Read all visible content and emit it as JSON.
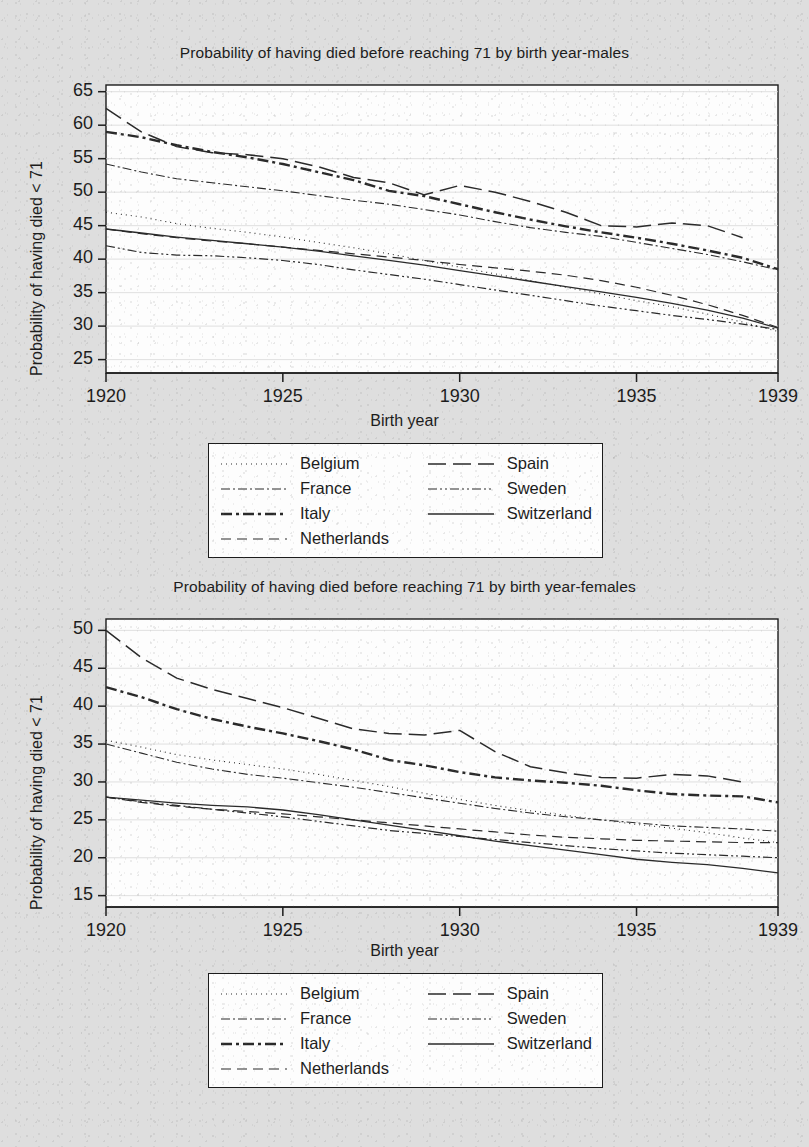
{
  "figure": {
    "background_color": "#dedede",
    "panel_background": "#fdfdfd",
    "line_color": "#2a2a2a",
    "axis_color": "#1c1c1c",
    "grid_color": "#d8d8d8"
  },
  "panels": [
    {
      "id": "males",
      "title": "Probability of having died before reaching 71 by birth year-males",
      "xlabel": "Birth year",
      "ylabel": "Probability of having died < 71",
      "yticks": [
        25,
        30,
        35,
        40,
        45,
        50,
        55,
        60,
        65
      ],
      "xticks": [
        1920,
        1925,
        1930,
        1935,
        1939
      ]
    },
    {
      "id": "females",
      "title": "Probability of having died before reaching 71 by birth year-females",
      "xlabel": "Birth year",
      "ylabel": "Probability of having died < 71",
      "yticks": [
        15,
        20,
        25,
        30,
        35,
        40,
        45,
        50
      ],
      "xticks": [
        1920,
        1925,
        1930,
        1935,
        1939
      ]
    }
  ],
  "legend": {
    "columns": [
      [
        {
          "label": "Belgium",
          "dash": "1,4",
          "width": 1.1
        },
        {
          "label": "France",
          "dash": "9,3,2,3",
          "width": 1.1
        },
        {
          "label": "Italy",
          "dash": "11,4,3,4",
          "width": 2.4
        },
        {
          "label": "Netherlands",
          "dash": "10,6",
          "width": 1.2
        }
      ],
      [
        {
          "label": "Spain",
          "dash": "18,7",
          "width": 1.5
        },
        {
          "label": "Sweden",
          "dash": "9,3,2,3,2,3",
          "width": 1.2
        },
        {
          "label": "Switzerland",
          "dash": "none",
          "width": 1.3
        }
      ]
    ]
  },
  "chart_data": [
    {
      "type": "line",
      "id": "males",
      "title": "Probability of having died before reaching 71 by birth year-males",
      "xlabel": "Birth year",
      "ylabel": "Probability of having died < 71",
      "xlim": [
        1920,
        1939
      ],
      "ylim": [
        23,
        66
      ],
      "ytick_values": [
        25,
        30,
        35,
        40,
        45,
        50,
        55,
        60,
        65
      ],
      "xtick_values": [
        1920,
        1925,
        1930,
        1935,
        1939
      ],
      "grid": "horizontal",
      "legend_position": "below-plot",
      "x": [
        1920,
        1921,
        1922,
        1923,
        1924,
        1925,
        1926,
        1927,
        1928,
        1929,
        1930,
        1931,
        1932,
        1933,
        1934,
        1935,
        1936,
        1937,
        1938,
        1939
      ],
      "series": [
        {
          "name": "Belgium",
          "dash": "1,4",
          "width": 1.1,
          "values": [
            47.0,
            46.3,
            45.3,
            44.6,
            44.0,
            43.3,
            42.5,
            41.7,
            40.8,
            39.8,
            38.8,
            37.8,
            36.8,
            35.8,
            34.8,
            33.8,
            32.9,
            31.8,
            30.6,
            29.2
          ]
        },
        {
          "name": "France",
          "dash": "9,3,2,3",
          "width": 1.1,
          "values": [
            54.2,
            53.0,
            52.0,
            51.4,
            50.8,
            50.2,
            49.5,
            48.8,
            48.2,
            47.4,
            46.6,
            45.6,
            44.7,
            44.0,
            43.4,
            42.5,
            41.6,
            40.7,
            39.6,
            38.4
          ]
        },
        {
          "name": "Italy",
          "dash": "11,4,3,4",
          "width": 2.4,
          "values": [
            59.0,
            58.2,
            57.0,
            56.0,
            55.2,
            54.2,
            53.0,
            51.8,
            50.2,
            49.4,
            48.2,
            47.0,
            45.9,
            44.9,
            44.0,
            43.2,
            42.3,
            41.3,
            40.2,
            38.5
          ]
        },
        {
          "name": "Netherlands",
          "dash": "10,6",
          "width": 1.2,
          "values": [
            44.5,
            43.8,
            43.2,
            42.7,
            42.3,
            41.8,
            41.3,
            40.8,
            40.3,
            39.8,
            39.2,
            38.7,
            38.2,
            37.6,
            36.8,
            35.8,
            34.6,
            33.2,
            31.6,
            29.8
          ]
        },
        {
          "name": "Spain",
          "dash": "18,7",
          "width": 1.5,
          "values": [
            62.5,
            59.0,
            56.8,
            55.9,
            55.6,
            55.0,
            53.8,
            52.2,
            51.4,
            49.6,
            51.0,
            50.0,
            48.6,
            47.0,
            45.0,
            44.8,
            45.4,
            45.0,
            43.2,
            null
          ]
        },
        {
          "name": "Sweden",
          "dash": "9,3,2,3,2,3",
          "width": 1.2,
          "values": [
            42.0,
            41.0,
            40.6,
            40.5,
            40.2,
            39.8,
            39.2,
            38.4,
            37.7,
            37.0,
            36.2,
            35.4,
            34.6,
            33.8,
            33.0,
            32.3,
            31.6,
            31.0,
            30.3,
            29.5
          ]
        },
        {
          "name": "Switzerland",
          "dash": "none",
          "width": 1.3,
          "values": [
            44.5,
            43.9,
            43.3,
            42.8,
            42.3,
            41.8,
            41.2,
            40.5,
            39.8,
            39.1,
            38.3,
            37.5,
            36.7,
            35.9,
            35.1,
            34.3,
            33.4,
            32.4,
            31.2,
            29.7
          ]
        }
      ]
    },
    {
      "type": "line",
      "id": "females",
      "title": "Probability of having died before reaching 71 by birth year-females",
      "xlabel": "Birth year",
      "ylabel": "Probability of having died < 71",
      "xlim": [
        1920,
        1939
      ],
      "ylim": [
        13.5,
        51.5
      ],
      "ytick_values": [
        15,
        20,
        25,
        30,
        35,
        40,
        45,
        50
      ],
      "xtick_values": [
        1920,
        1925,
        1930,
        1935,
        1939
      ],
      "grid": "horizontal",
      "legend_position": "below-plot",
      "x": [
        1920,
        1921,
        1922,
        1923,
        1924,
        1925,
        1926,
        1927,
        1928,
        1929,
        1930,
        1931,
        1932,
        1933,
        1934,
        1935,
        1936,
        1937,
        1938,
        1939
      ],
      "series": [
        {
          "name": "Belgium",
          "dash": "1,4",
          "width": 1.1,
          "values": [
            35.5,
            34.6,
            33.6,
            32.9,
            32.3,
            31.7,
            31.0,
            30.2,
            29.4,
            28.5,
            27.7,
            26.9,
            26.2,
            25.6,
            25.0,
            24.4,
            23.9,
            23.3,
            22.6,
            22.0
          ]
        },
        {
          "name": "France",
          "dash": "9,3,2,3",
          "width": 1.1,
          "values": [
            35.0,
            33.8,
            32.6,
            31.7,
            31.0,
            30.5,
            29.9,
            29.3,
            28.6,
            27.9,
            27.2,
            26.5,
            25.9,
            25.4,
            25.0,
            24.6,
            24.2,
            24.0,
            23.8,
            23.5
          ]
        },
        {
          "name": "Italy",
          "dash": "11,4,3,4",
          "width": 2.4,
          "values": [
            42.5,
            41.2,
            39.6,
            38.3,
            37.3,
            36.4,
            35.4,
            34.3,
            32.9,
            32.2,
            31.3,
            30.6,
            30.2,
            29.9,
            29.5,
            28.9,
            28.4,
            28.2,
            28.1,
            27.3
          ]
        },
        {
          "name": "Netherlands",
          "dash": "10,6",
          "width": 1.2,
          "values": [
            28.0,
            27.3,
            26.8,
            26.4,
            26.1,
            25.8,
            25.4,
            25.0,
            24.6,
            24.2,
            23.8,
            23.4,
            23.0,
            22.7,
            22.5,
            22.3,
            22.2,
            22.1,
            22.0,
            22.0
          ]
        },
        {
          "name": "Spain",
          "dash": "18,7",
          "width": 1.5,
          "values": [
            50.0,
            46.4,
            43.7,
            42.2,
            41.0,
            39.8,
            38.4,
            37.0,
            36.4,
            36.2,
            36.8,
            34.0,
            32.0,
            31.2,
            30.6,
            30.5,
            31.0,
            30.8,
            30.0,
            null
          ]
        },
        {
          "name": "Sweden",
          "dash": "9,3,2,3,2,3",
          "width": 1.2,
          "values": [
            28.0,
            27.4,
            26.9,
            26.4,
            25.9,
            25.4,
            24.8,
            24.2,
            23.6,
            23.2,
            22.8,
            22.4,
            22.0,
            21.6,
            21.2,
            20.9,
            20.6,
            20.4,
            20.2,
            20.0
          ]
        },
        {
          "name": "Switzerland",
          "dash": "none",
          "width": 1.3,
          "values": [
            28.0,
            27.6,
            27.2,
            26.9,
            26.7,
            26.3,
            25.7,
            25.0,
            24.3,
            23.6,
            22.9,
            22.2,
            21.6,
            21.0,
            20.4,
            19.8,
            19.4,
            19.1,
            18.6,
            18.0
          ]
        }
      ]
    }
  ]
}
